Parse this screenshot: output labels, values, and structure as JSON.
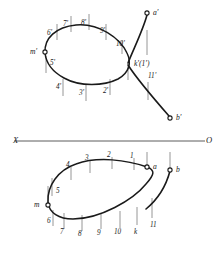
{
  "figure": {
    "background_color": "#ffffff",
    "curve_color": "#1a1a1a",
    "tick_color": "#8a8a8a",
    "axis_color": "#4a4a4a"
  },
  "axis": {
    "left_label": "X",
    "right_label": "O",
    "y": 141,
    "x_start": 14,
    "x_end": 205
  },
  "upper_view": {
    "name": "frontal-projection",
    "points": [
      {
        "id": "a-prime",
        "label": "a'",
        "x": 147,
        "y": 13,
        "marker": true,
        "lx": 153,
        "ly": 9
      },
      {
        "id": "b-prime",
        "label": "b'",
        "x": 170,
        "y": 118,
        "marker": true,
        "lx": 176,
        "ly": 114
      },
      {
        "id": "m-prime",
        "label": "m'",
        "x": 45,
        "y": 52,
        "marker": true,
        "lx": 30,
        "ly": 48
      },
      {
        "id": "k-prime",
        "label": "k'(1')",
        "x": 128,
        "y": 64,
        "marker": false,
        "lx": 134,
        "ly": 60
      }
    ],
    "ticks": [
      {
        "label": "2'",
        "lx": 103,
        "ly": 88,
        "tx": 110,
        "ty": 79,
        "th": 16,
        "dir": "down"
      },
      {
        "label": "3'",
        "lx": 79,
        "ly": 90,
        "tx": 86,
        "ty": 84,
        "th": 17,
        "dir": "down"
      },
      {
        "label": "4'",
        "lx": 56,
        "ly": 84,
        "tx": 63,
        "ty": 79,
        "th": 17,
        "dir": "down"
      },
      {
        "label": "5'",
        "lx": 50,
        "ly": 60,
        "tx": 46,
        "ty": 56,
        "th": 17,
        "dir": "down"
      },
      {
        "label": "6'",
        "lx": 47,
        "ly": 30,
        "tx": 57,
        "ty": 40,
        "th": -16,
        "dir": "up"
      },
      {
        "label": "7'",
        "lx": 63,
        "ly": 21,
        "tx": 71,
        "ty": 32,
        "th": -16,
        "dir": "up"
      },
      {
        "label": "8'",
        "lx": 81,
        "ly": 20,
        "tx": 89,
        "ty": 30,
        "th": -16,
        "dir": "up"
      },
      {
        "label": "9'",
        "lx": 100,
        "ly": 28,
        "tx": 106,
        "ty": 40,
        "th": -16,
        "dir": "up"
      },
      {
        "label": "10'",
        "lx": 116,
        "ly": 41,
        "tx": 122,
        "ty": 54,
        "th": -14,
        "dir": "up"
      },
      {
        "label": "11'",
        "lx": 148,
        "ly": 73,
        "tx": 148,
        "ty": 82,
        "th": 18,
        "dir": "down"
      },
      {
        "label": "",
        "lx": 0,
        "ly": 0,
        "tx": 147,
        "ty": 30,
        "th": 25,
        "dir": "down"
      },
      {
        "label": "",
        "lx": 0,
        "ly": 0,
        "tx": 128,
        "ty": 66,
        "th": 14,
        "dir": "down"
      }
    ]
  },
  "lower_view": {
    "name": "horizontal-projection",
    "points": [
      {
        "id": "a",
        "label": "a",
        "x": 147,
        "y": 167,
        "marker": true,
        "lx": 153,
        "ly": 163
      },
      {
        "id": "b",
        "label": "b",
        "x": 170,
        "y": 170,
        "marker": true,
        "lx": 176,
        "ly": 166
      },
      {
        "id": "m",
        "label": "m",
        "x": 48,
        "y": 205,
        "marker": true,
        "lx": 34,
        "ly": 201
      }
    ],
    "ticks": [
      {
        "label": "1",
        "lx": 130,
        "ly": 153,
        "tx": 134,
        "ty": 158,
        "th": 12,
        "dir": "up"
      },
      {
        "label": "2",
        "lx": 107,
        "ly": 152,
        "tx": 112,
        "ty": 157,
        "th": 12,
        "dir": "up"
      },
      {
        "label": "3",
        "lx": 85,
        "ly": 155,
        "tx": 90,
        "ty": 161,
        "th": 12,
        "dir": "up"
      },
      {
        "label": "4",
        "lx": 66,
        "ly": 162,
        "tx": 71,
        "ty": 167,
        "th": 13,
        "dir": "up"
      },
      {
        "label": "5",
        "lx": 56,
        "ly": 188,
        "tx": 52,
        "ty": 178,
        "th": 18,
        "dir": "up"
      },
      {
        "label": "6",
        "lx": 47,
        "ly": 218,
        "tx": 53,
        "ty": 210,
        "th": 16,
        "dir": "down"
      },
      {
        "label": "7",
        "lx": 60,
        "ly": 229,
        "tx": 64,
        "ty": 213,
        "th": 16,
        "dir": "down"
      },
      {
        "label": "8",
        "lx": 78,
        "ly": 231,
        "tx": 82,
        "ty": 215,
        "th": 16,
        "dir": "down"
      },
      {
        "label": "9",
        "lx": 97,
        "ly": 230,
        "tx": 101,
        "ty": 213,
        "th": 16,
        "dir": "down"
      },
      {
        "label": "10",
        "lx": 114,
        "ly": 229,
        "tx": 120,
        "ty": 211,
        "th": 17,
        "dir": "down"
      },
      {
        "label": "k",
        "lx": 134,
        "ly": 229,
        "tx": 137,
        "ty": 207,
        "th": 18,
        "dir": "down"
      },
      {
        "label": "11",
        "lx": 150,
        "ly": 222,
        "tx": 152,
        "ty": 198,
        "th": 20,
        "dir": "down"
      },
      {
        "label": "",
        "lx": 0,
        "ly": 0,
        "tx": 147,
        "ty": 152,
        "th": 14,
        "dir": "down"
      },
      {
        "label": "",
        "lx": 0,
        "ly": 0,
        "tx": 170,
        "ty": 152,
        "th": 16,
        "dir": "down"
      },
      {
        "label": "",
        "lx": 0,
        "ly": 0,
        "tx": 48,
        "ty": 186,
        "th": 18,
        "dir": "down"
      }
    ]
  },
  "curves": {
    "upper_loop": "M 45,53 C 44,38 56,27 76,25 C 99,23 120,38 127,53 C 132,63 129,73 118,79 C 104,86 80,87 64,78 C 51,71 46,62 45,53 Z",
    "upper_tail_a": "M 147,15 C 143,30 134,48 128,63",
    "upper_tail_b": "M 128,65 C 137,79 155,100 169,116",
    "lower_loop": "M 147,167 C 127,160 98,156 76,164 C 58,170 47,186 48,202 C 49,213 59,219 73,219 C 100,219 133,200 146,184 C 155,174 155,170 147,167 Z",
    "lower_tail_b": "M 170,171 C 166,186 157,200 146,209"
  }
}
